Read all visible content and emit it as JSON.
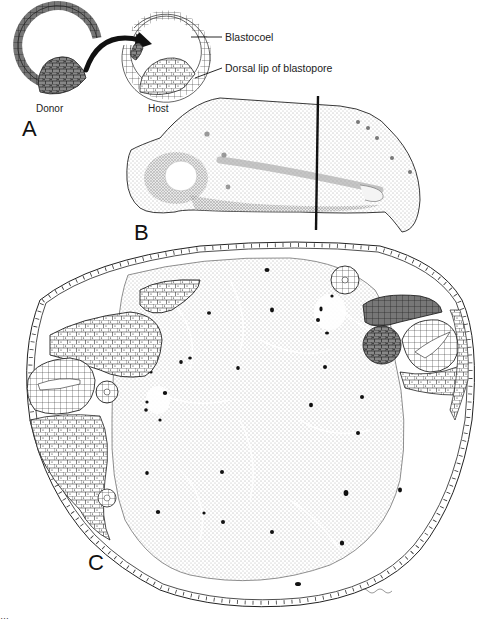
{
  "figure": {
    "panels": {
      "A": {
        "letter": "A",
        "donor_label": "Donor",
        "host_label": "Host",
        "callouts": {
          "blastocoel": "Blastocoel",
          "dorsal_lip": "Dorsal lip of blastopore"
        }
      },
      "B": {
        "letter": "B"
      },
      "C": {
        "letter": "C"
      }
    },
    "caption": "…"
  }
}
